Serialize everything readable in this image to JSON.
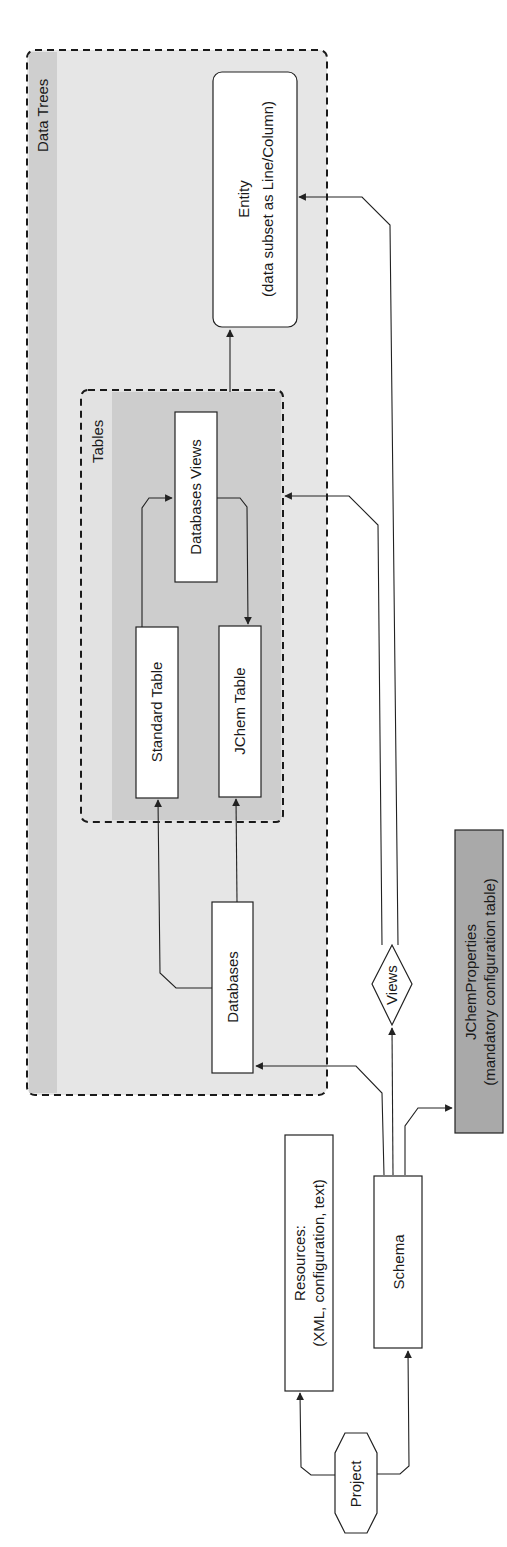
{
  "diagram": {
    "orientation": "rotated 90° counter-clockwise",
    "colors": {
      "outer_group_fill": "#e6e6e6",
      "outer_group_strip": "#cfcfcf",
      "inner_group_fill": "#cdcdcd",
      "inner_group_strip": "#e2e2e2",
      "node_fill": "#ffffff",
      "config_node_fill": "#a9a9a9",
      "stroke": "#222222"
    },
    "groups": {
      "data_trees": {
        "label": "Data Trees"
      },
      "tables": {
        "label": "Tables"
      }
    },
    "nodes": {
      "entity": {
        "line1": "Entity",
        "line2": "(data subset as Line/Column)"
      },
      "databases_views": {
        "label": "Databases Views"
      },
      "standard_table": {
        "label": "Standard Table"
      },
      "jchem_table": {
        "label": "JChem Table"
      },
      "databases": {
        "label": "Databases"
      },
      "views": {
        "label": "Views"
      },
      "jchem_properties": {
        "line1": "JChemProperties",
        "line2": "(mandatory configuration table)"
      },
      "resources": {
        "line1": "Resources:",
        "line2": "(XML, configuration, text)"
      },
      "schema": {
        "label": "Schema"
      },
      "project": {
        "label": "Project"
      }
    },
    "edges": [
      {
        "from": "Project",
        "to": "Resources"
      },
      {
        "from": "Project",
        "to": "Schema"
      },
      {
        "from": "Schema",
        "to": "Databases"
      },
      {
        "from": "Schema",
        "to": "Views"
      },
      {
        "from": "Schema",
        "to": "JChemProperties"
      },
      {
        "from": "Views",
        "to": "Tables"
      },
      {
        "from": "Views",
        "to": "Entity"
      },
      {
        "from": "Databases",
        "to": "Standard Table"
      },
      {
        "from": "Databases",
        "to": "JChem Table"
      },
      {
        "from": "Standard Table",
        "to": "Databases Views"
      },
      {
        "from": "Databases Views",
        "to": "JChem Table"
      },
      {
        "from": "Tables",
        "to": "Entity"
      }
    ]
  }
}
